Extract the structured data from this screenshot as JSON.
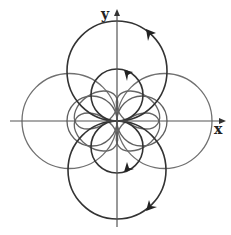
{
  "diagram": {
    "type": "polar-curves",
    "axes": {
      "x_label": "x",
      "y_label": "y",
      "origin": [
        117,
        121
      ]
    },
    "colors": {
      "axis": "#555555",
      "outer_curves": "#666666",
      "highlight_curves": "#333333",
      "background": "#ffffff"
    },
    "circles": [
      {
        "name": "large-top",
        "cx": 117,
        "cy": 71,
        "r": 50,
        "emphasis": true
      },
      {
        "name": "large-bottom",
        "cx": 117,
        "cy": 170,
        "r": 49,
        "emphasis": true
      },
      {
        "name": "large-left",
        "cx": 69.5,
        "cy": 121,
        "r": 47.5,
        "emphasis": false
      },
      {
        "name": "large-right",
        "cx": 164.5,
        "cy": 121,
        "r": 47.5,
        "emphasis": false
      },
      {
        "name": "small-top",
        "cx": 117,
        "cy": 95,
        "r": 26,
        "emphasis": true
      },
      {
        "name": "small-bottom",
        "cx": 117,
        "cy": 147,
        "r": 26,
        "emphasis": true
      },
      {
        "name": "small-left",
        "cx": 92,
        "cy": 121,
        "r": 25,
        "emphasis": false
      },
      {
        "name": "small-right",
        "cx": 142,
        "cy": 121,
        "r": 25,
        "emphasis": false
      }
    ],
    "direction_arrows": [
      {
        "on": "large-top",
        "at": [
          151,
          34
        ],
        "direction": "counterclockwise"
      },
      {
        "on": "small-top",
        "at": [
          129,
          74
        ],
        "direction": "counterclockwise"
      },
      {
        "on": "small-bottom",
        "at": [
          129,
          167
        ],
        "direction": "counterclockwise"
      },
      {
        "on": "large-bottom",
        "at": [
          151,
          206
        ],
        "direction": "counterclockwise"
      }
    ]
  }
}
